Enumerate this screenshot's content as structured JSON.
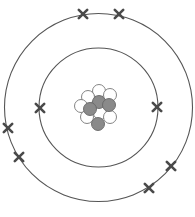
{
  "diagram": {
    "colors": {
      "shell": "#555555",
      "electron": "#4a4a4a",
      "proton_fill": "#8a8a8a",
      "neutron_fill": "#ffffff",
      "particle_stroke": "#777777"
    },
    "center": [
      98.5,
      107.5
    ],
    "shells": [
      {
        "name": "inner-shell",
        "radius": 59.5,
        "electrons": [
          [
            40,
            108
          ],
          [
            157,
            107
          ]
        ]
      },
      {
        "name": "outer-shell",
        "radius": 94,
        "electrons": [
          [
            83,
            14
          ],
          [
            119,
            14
          ],
          [
            8,
            128
          ],
          [
            19,
            157
          ],
          [
            171,
            166
          ],
          [
            149,
            188
          ]
        ]
      }
    ],
    "nucleus": {
      "neutrons": [
        [
          99,
          91
        ],
        [
          110,
          95
        ],
        [
          88,
          97
        ],
        [
          81,
          106
        ],
        [
          100,
          113
        ],
        [
          87,
          117
        ],
        [
          110,
          117
        ]
      ],
      "protons": [
        [
          99,
          102
        ],
        [
          109,
          105
        ],
        [
          90,
          109
        ],
        [
          98,
          124
        ]
      ],
      "particle_radius": 6.5
    }
  }
}
